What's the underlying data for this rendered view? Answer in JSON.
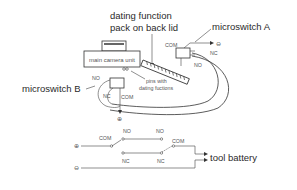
{
  "labels": {
    "dating_pack_line1": "dating function",
    "dating_pack_line2": "pack on back lid",
    "microswitch_a": "microswitch A",
    "microswitch_b": "microswitch B",
    "main_camera_unit": "main camera unit",
    "pins_line1": "pins with",
    "pins_line2": "dating fuctions",
    "tool_battery": "tool battery"
  },
  "switch_a": {
    "com": "COM",
    "nc": "NC",
    "no": "NO",
    "terminal": "⊖"
  },
  "switch_b": {
    "com": "COM",
    "nc": "NC",
    "no": "NO",
    "terminal": "⊕"
  },
  "schematic": {
    "plus_terminal": "⊕",
    "minus_terminal": "⊖",
    "switch1": {
      "com": "COM",
      "no": "NO",
      "nc": "NC"
    },
    "switch2": {
      "com": "COM",
      "no": "NO",
      "nc": "NC"
    }
  },
  "colors": {
    "line": "#333333",
    "text": "#2a2a2a",
    "background": "#ffffff"
  }
}
